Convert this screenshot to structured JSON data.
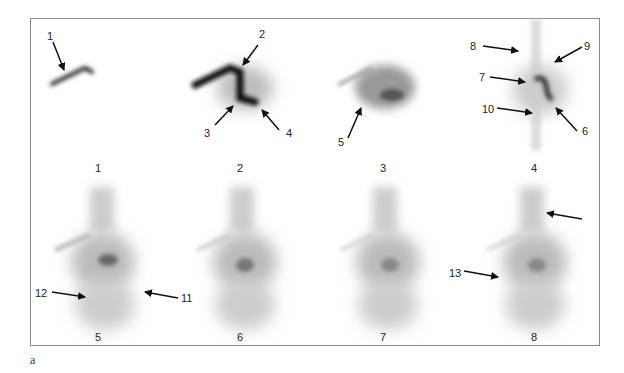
{
  "figure": {
    "panel_label": "a",
    "frames": [
      {
        "number": "1"
      },
      {
        "number": "2"
      },
      {
        "number": "3"
      },
      {
        "number": "4"
      },
      {
        "number": "5"
      },
      {
        "number": "6"
      },
      {
        "number": "7"
      },
      {
        "number": "8"
      }
    ],
    "annotations": [
      {
        "label": "1"
      },
      {
        "label": "2"
      },
      {
        "label": "3"
      },
      {
        "label": "4"
      },
      {
        "label": "5"
      },
      {
        "label": "6"
      },
      {
        "label": "7"
      },
      {
        "label": "8"
      },
      {
        "label": "9"
      },
      {
        "label": "10"
      },
      {
        "label": "11"
      },
      {
        "label": "12"
      },
      {
        "label": "13"
      },
      {
        "label": ""
      }
    ]
  }
}
